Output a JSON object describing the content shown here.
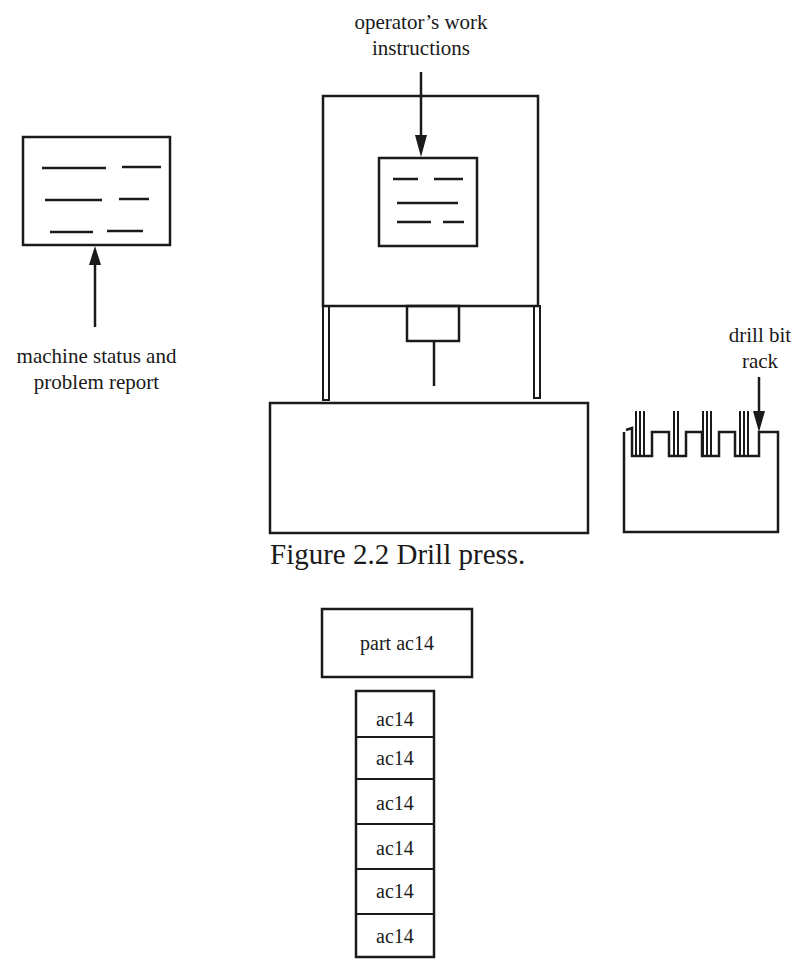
{
  "figure": {
    "caption": "Figure 2.2 Drill press.",
    "labels": {
      "work_instructions_line1": "operator’s work",
      "work_instructions_line2": "instructions",
      "status_report_line1": "machine status and",
      "status_report_line2": "problem report",
      "bit_rack_line1": "drill bit",
      "bit_rack_line2": "rack"
    }
  },
  "parts": {
    "header": "part ac14",
    "stack": [
      "ac14",
      "ac14",
      "ac14",
      "ac14",
      "ac14",
      "ac14"
    ]
  },
  "colors": {
    "ink": "#1a1a1a",
    "background": "#ffffff"
  }
}
